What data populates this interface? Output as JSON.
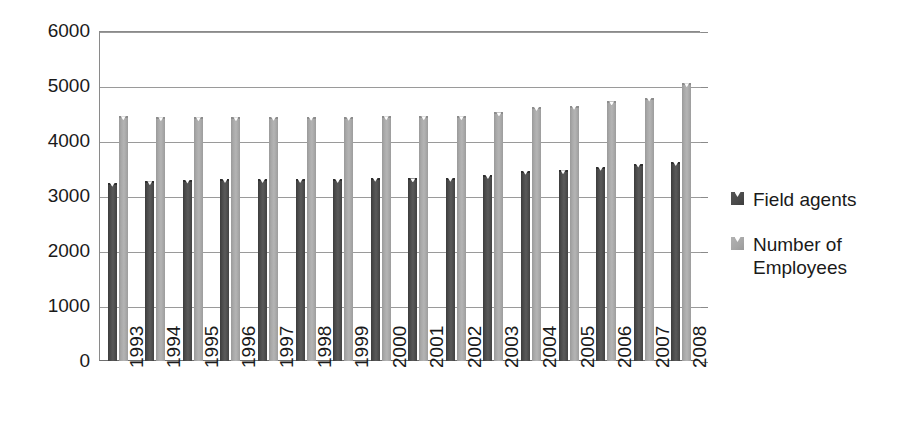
{
  "chart_data": {
    "type": "bar",
    "title": "",
    "subtitle": "",
    "xlabel": "",
    "ylabel": "",
    "ylim": [
      0,
      6000
    ],
    "ytick_step": 1000,
    "yticks": [
      "0",
      "1000",
      "2000",
      "3000",
      "4000",
      "5000",
      "6000"
    ],
    "grid": true,
    "legend_position": "right",
    "categories": [
      "1993",
      "1994",
      "1995",
      "1996",
      "1997",
      "1998",
      "1999",
      "2000",
      "2001",
      "2002",
      "2003",
      "2004",
      "2005",
      "2006",
      "2007",
      "2008"
    ],
    "series": [
      {
        "name": "Field agents",
        "color": "#4a4a4a",
        "values": [
          3240,
          3270,
          3300,
          3310,
          3310,
          3310,
          3310,
          3330,
          3320,
          3330,
          3380,
          3460,
          3470,
          3530,
          3590,
          3620
        ]
      },
      {
        "name": "Number of Employees",
        "color": "#a8a8a8",
        "values": [
          4450,
          4430,
          4430,
          4430,
          4440,
          4440,
          4440,
          4450,
          4450,
          4450,
          4520,
          4620,
          4640,
          4720,
          4790,
          5050
        ]
      }
    ]
  },
  "legend": {
    "items": [
      {
        "label": "Field agents",
        "swatch": "dark-square-swatch"
      },
      {
        "label": "Number of Employees",
        "swatch": "light-square-swatch"
      }
    ]
  }
}
